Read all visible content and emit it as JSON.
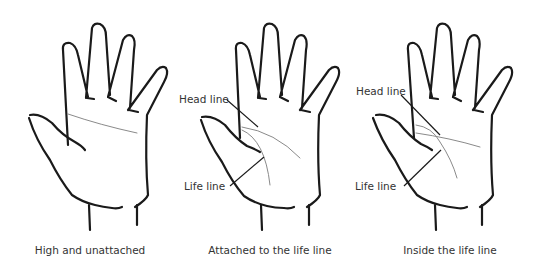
{
  "figure": {
    "panels": [
      {
        "caption": "High and unattached",
        "labels": []
      },
      {
        "caption": "Attached to the life line",
        "labels": {
          "head_line": "Head line",
          "life_line": "Life line"
        }
      },
      {
        "caption": "Inside the life line",
        "labels": {
          "head_line": "Head line",
          "life_line": "Life line"
        }
      }
    ],
    "colors": {
      "outline": "#1a1a1a",
      "palm_line": "#8a8a8a",
      "text": "#333333"
    }
  }
}
